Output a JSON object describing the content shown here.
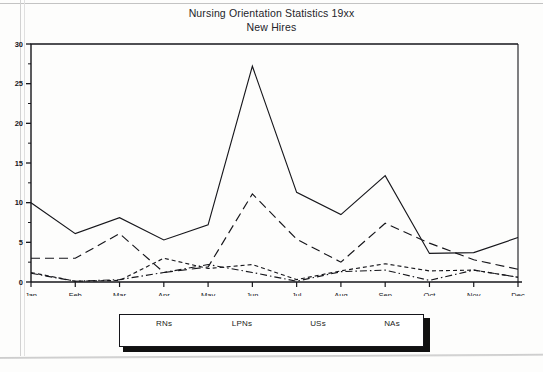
{
  "title": {
    "line1": "Nursing Orientation Statistics 19xx",
    "line2": "New Hires"
  },
  "legend": {
    "items": [
      {
        "label": "RNs",
        "style": "solid"
      },
      {
        "label": "LPNs",
        "style": "long-dash"
      },
      {
        "label": "USs",
        "style": "dash-dot"
      },
      {
        "label": "NAs",
        "style": "short-dash"
      }
    ]
  },
  "chart_data": {
    "type": "line",
    "xlabel": "",
    "ylabel": "",
    "ylim": [
      0,
      30
    ],
    "yticks": [
      0,
      5,
      10,
      15,
      20,
      25,
      30
    ],
    "yticks_minor": [
      2.5,
      7.5,
      12.5,
      17.5,
      22.5,
      27.5
    ],
    "grid": false,
    "legend_position": "bottom",
    "categories": [
      "Jan",
      "Feb",
      "Mar",
      "Apr",
      "May",
      "Jun",
      "Jul",
      "Aug",
      "Sep",
      "Oct",
      "Nov",
      "Dec"
    ],
    "series": [
      {
        "name": "RNs",
        "dash": "solid",
        "values": [
          10,
          6.1,
          8.1,
          5.3,
          7.2,
          27.2,
          11.3,
          8.5,
          13.4,
          3.6,
          3.7,
          5.6
        ]
      },
      {
        "name": "LPNs",
        "dash": "long-dash",
        "values": [
          3,
          3,
          6.1,
          1.2,
          1.9,
          11.1,
          5.4,
          2.5,
          7.4,
          4.9,
          2.8,
          1.6
        ]
      },
      {
        "name": "USs",
        "dash": "dash-dot",
        "values": [
          1.1,
          0.1,
          0.3,
          1.2,
          2.2,
          1.2,
          0.1,
          1.3,
          1.5,
          0.2,
          1.5,
          0.6
        ]
      },
      {
        "name": "NAs",
        "dash": "short-dash",
        "values": [
          1.2,
          0.1,
          0.2,
          3,
          1.7,
          2.2,
          0.3,
          1.4,
          2.3,
          1.4,
          1.5,
          0.6
        ]
      }
    ]
  }
}
